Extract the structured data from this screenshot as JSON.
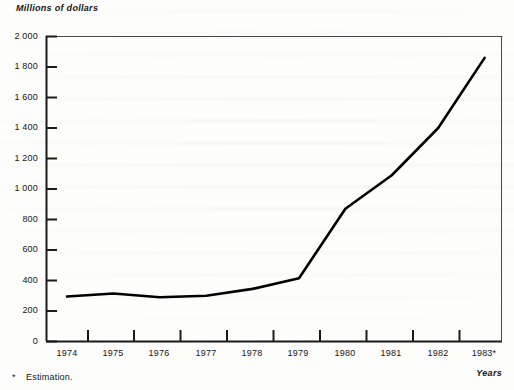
{
  "figure": {
    "title": "Millions of dollars",
    "xaxis_title": "Years",
    "footnote_marker": "*",
    "footnote_text": "Estimation."
  },
  "chart_data": {
    "type": "line",
    "title": "Millions of dollars",
    "xlabel": "Years",
    "ylabel": "Millions of dollars",
    "categories": [
      "1974",
      "1975",
      "1976",
      "1977",
      "1978",
      "1979",
      "1980",
      "1981",
      "1982",
      "1983*"
    ],
    "x": [
      1974,
      1975,
      1976,
      1977,
      1978,
      1979,
      1980,
      1981,
      1982,
      1983
    ],
    "values": [
      295,
      315,
      290,
      300,
      345,
      415,
      870,
      1090,
      1400,
      1860
    ],
    "series": [
      {
        "name": "Millions of dollars",
        "values": [
          295,
          315,
          290,
          300,
          345,
          415,
          870,
          1090,
          1400,
          1860
        ]
      }
    ],
    "ylim": [
      0,
      2000
    ],
    "yticks": [
      0,
      200,
      400,
      600,
      800,
      1000,
      1200,
      1400,
      1600,
      1800,
      2000
    ],
    "ytick_labels": [
      "0",
      "200",
      "400",
      "600",
      "800",
      "1 000",
      "1 200",
      "1 400",
      "1 600",
      "1 800",
      "2 000"
    ],
    "xtick_labels": [
      "1974",
      "1975",
      "1976",
      "1977",
      "1978",
      "1979",
      "1980",
      "1981",
      "1982",
      "1983*"
    ],
    "grid": false,
    "legend": "none",
    "line_color": "#000000",
    "line_width": 2.6,
    "axis_color": "#1a1a1a",
    "background": "#fdfdfc",
    "annotations": [
      "* Estimation."
    ]
  }
}
